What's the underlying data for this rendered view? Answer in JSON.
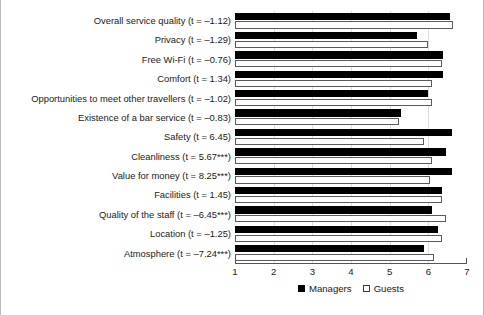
{
  "chart_data": {
    "type": "bar",
    "orientation": "horizontal",
    "title": "",
    "subtitle": "",
    "xlabel": "",
    "ylabel": "",
    "xlim": [
      1,
      7
    ],
    "xticks": [
      "1",
      "2",
      "3",
      "4",
      "5",
      "6",
      "7"
    ],
    "grid": true,
    "legend_position": "bottom-center",
    "categories": [
      "Overall service quality (t = –1.12)",
      "Privacy (t = –1.29)",
      "Free Wi-Fi (t = –0.76)",
      "Comfort (t = 1.34)",
      "Opportunities to meet other travellers (t = –1.02)",
      "Existence of a bar service (t = –0.83)",
      "Safety (t = 6.45)",
      "Cleanliness (t = 5.67***)",
      "Value for money (t = 8.25***)",
      "Facilities (t = 1.45)",
      "Quality of the staff (t = –6.45***)",
      "Location (t = –1.25)",
      "Atmosphere (t = –7.24***)"
    ],
    "series": [
      {
        "name": "Managers",
        "color": "#000000",
        "values": [
          6.55,
          5.7,
          6.38,
          6.38,
          6.0,
          5.3,
          6.6,
          6.45,
          6.6,
          6.35,
          6.1,
          6.25,
          5.9
        ]
      },
      {
        "name": "Guests",
        "color": "#ffffff",
        "values": [
          6.65,
          6.0,
          6.35,
          6.1,
          6.1,
          5.25,
          5.9,
          6.1,
          6.05,
          6.35,
          6.45,
          6.35,
          6.15
        ]
      }
    ]
  },
  "legend": {
    "entries": [
      {
        "label": "Managers",
        "style": "filled"
      },
      {
        "label": "Guests",
        "style": "open"
      }
    ]
  }
}
